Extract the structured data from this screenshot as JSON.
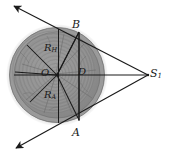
{
  "figure": {
    "canvas": {
      "width": 172,
      "height": 160
    },
    "colors": {
      "background": "#ffffff",
      "line": "#1a1a1a",
      "disc_fill": "#8e8e8e",
      "disc_outer_ring": "#9a9a9a",
      "disc_shadow": "#b4b4b4",
      "ring_stroke": "#7b7b7b",
      "label_text": "#1a1a1a"
    },
    "circle": {
      "center_label": "O",
      "center_x": 57,
      "center_y": 75,
      "outer_radius": 48,
      "inner_radius": 43
    },
    "points": [
      {
        "name": "O",
        "label": "O",
        "x": 57,
        "y": 75,
        "role": "center"
      },
      {
        "name": "B",
        "label": "B",
        "x": 79,
        "y": 32,
        "role": "upper-tangent-point"
      },
      {
        "name": "A",
        "label": "A",
        "x": 79,
        "y": 120,
        "role": "lower-tangent-point"
      },
      {
        "name": "S1",
        "label": "S",
        "sub": "1",
        "x": 148,
        "y": 75,
        "role": "external-source-point"
      }
    ],
    "labels": [
      {
        "name": "point-label-B",
        "text": "B",
        "sub": ""
      },
      {
        "name": "point-label-A",
        "text": "A",
        "sub": ""
      },
      {
        "name": "point-label-O",
        "text": "O",
        "sub": ""
      },
      {
        "name": "dimension-label-D",
        "text": "D",
        "sub": ""
      },
      {
        "name": "point-label-S1",
        "text": "S",
        "sub": "1"
      },
      {
        "name": "radius-label-RH",
        "text": "R",
        "sub": "H"
      },
      {
        "name": "radius-label-RA",
        "text": "R",
        "sub": "A"
      }
    ],
    "label_text": {
      "B": "B",
      "A": "A",
      "O": "O",
      "D": "D",
      "S_main": "S",
      "S_sub": "1",
      "R_main": "R",
      "RH_sub": "H",
      "RA_sub": "A"
    },
    "lines": [
      {
        "name": "ray-upper-left",
        "from": "S1",
        "through": "B",
        "arrow": "upper-left",
        "style": "solid-arrow"
      },
      {
        "name": "ray-lower-left",
        "from": "S1",
        "through": "A",
        "arrow": "lower-left",
        "style": "solid-arrow"
      },
      {
        "name": "axis-horizontal",
        "from": "O",
        "to": "S1",
        "style": "solid"
      },
      {
        "name": "chord-vertical-B",
        "description": "vertical line through B",
        "style": "solid"
      },
      {
        "name": "chord-vertical-A",
        "description": "vertical line through A",
        "style": "solid"
      },
      {
        "name": "radius-OB",
        "from": "O",
        "to": "B",
        "style": "solid"
      },
      {
        "name": "radius-OA",
        "from": "O",
        "to": "A",
        "style": "solid"
      },
      {
        "name": "segment-BA",
        "from": "B",
        "to": "A",
        "style": "solid"
      },
      {
        "name": "radius-upper-left",
        "from": "O",
        "direction": "upper-left",
        "style": "solid"
      },
      {
        "name": "radius-lower-left",
        "from": "O",
        "direction": "lower-left",
        "style": "solid"
      },
      {
        "name": "radius-left",
        "from": "O",
        "direction": "left",
        "style": "solid"
      }
    ]
  }
}
